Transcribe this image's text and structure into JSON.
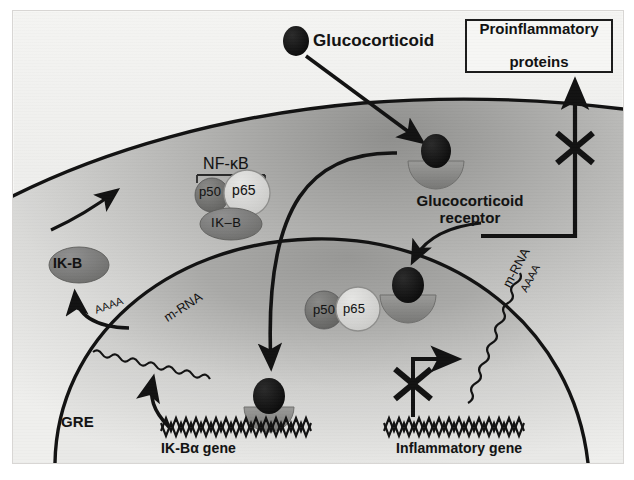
{
  "figure": {
    "background_color": "#f1f1ef",
    "frame_color": "#d8d6d4"
  },
  "labels": {
    "glucocorticoid": "Glucocorticoid",
    "glucocorticoid_receptor": "Glucocorticoid\nreceptor",
    "glucocorticoid_receptor_line1": "Glucocorticoid",
    "glucocorticoid_receptor_line2": "receptor",
    "proinflammatory_line1": "Proinflammatory",
    "proinflammatory_line2": "proteins",
    "nfkb": "NF-κB",
    "p50_cytoplasm": "p50",
    "p65_cytoplasm": "p65",
    "ikb_complex": "IK–B",
    "ikb_free": "IK-B",
    "p50_nucleus": "p50",
    "p65_nucleus": "p65",
    "gre": "GRE",
    "ikb_alpha_gene": "IK-Bα gene",
    "inflammatory_gene": "Inflammatory gene",
    "mrna_left": "m-RNA",
    "mrna_right": "m-RNA",
    "polya_left": "AAAA",
    "polya_right": "AAAA"
  },
  "colors": {
    "ligand_black": "#101010",
    "receptor_gray": "#8c8c8c",
    "p50_gray": "#707070",
    "p65_light": "#d5d5d3",
    "ikb_gray": "#787878",
    "membrane_black": "#111111",
    "cytoplasm_light": "#e9e9e7",
    "cytoplasm_dark": "#9a9a98",
    "nucleus_light": "#e4e4e2",
    "nucleus_dark": "#a2a2a0",
    "text_black": "#111111"
  },
  "elements": {
    "ligand_count_extracellular": 1,
    "ligand_count_cytoplasm": 1,
    "ligand_count_nucleus": 2,
    "blocked_arrow_inflammatory": true,
    "blocked_arrow_export": true,
    "dna_zigzag_genes": 2
  },
  "icons": {
    "block_x": "x-cross-icon",
    "arrow": "arrow-icon",
    "dna": "dna-zigzag-icon",
    "mrna_wave": "wavy-line-icon"
  }
}
